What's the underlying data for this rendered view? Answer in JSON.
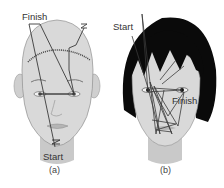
{
  "figure": {
    "panels": [
      {
        "id": "a",
        "caption": "(a)",
        "labels": {
          "finish": "Finish",
          "start": "Start"
        },
        "subject": "short-hair face"
      },
      {
        "id": "b",
        "caption": "(b)",
        "labels": {
          "start": "Start",
          "finish": "Finish"
        },
        "subject": "dark-hair face"
      }
    ]
  },
  "colors": {
    "skin": "#d9d9d9",
    "skin_shadow": "#bdbdbd",
    "hair": "#0a0a0a",
    "scan_path": "#3a3a3a",
    "label": "#333333"
  }
}
